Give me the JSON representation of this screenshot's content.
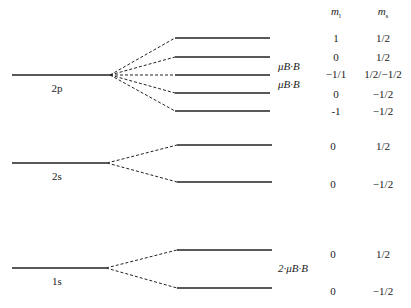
{
  "headers": {
    "ml": "m",
    "ml_sub": "l",
    "ms": "m",
    "ms_sub": "s"
  },
  "levels": {
    "2p": {
      "label": "2p"
    },
    "2s": {
      "label": "2s"
    },
    "1s": {
      "label": "1s"
    }
  },
  "annotations": {
    "muB_1": "μB·B",
    "muB_2": "μB·B",
    "two_muB": "2·μB·B"
  },
  "rows": [
    {
      "ml": "1",
      "ms": "1/2"
    },
    {
      "ml": "0",
      "ms": "1/2"
    },
    {
      "ml": "−1/1",
      "ms": "1/2/−1/2"
    },
    {
      "ml": "0",
      "ms": "−1/2"
    },
    {
      "ml": "-1",
      "ms": "−1/2"
    },
    {
      "ml": "0",
      "ms": "1/2"
    },
    {
      "ml": "0",
      "ms": "−1/2"
    },
    {
      "ml": "0",
      "ms": "1/2"
    },
    {
      "ml": "0",
      "ms": "−1/2"
    }
  ]
}
